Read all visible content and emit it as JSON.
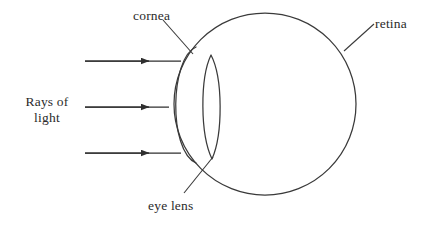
{
  "diagram": {
    "background_color": "#ffffff",
    "stroke_color": "#3a3a3a",
    "text_color": "#2b2b2b"
  },
  "labels": {
    "cornea": "cornea",
    "retina": "retina",
    "eye_lens": "eye lens",
    "rays_line1": "Rays of",
    "rays_line2": "light"
  },
  "parts": {
    "eyeball": {
      "name": "eyeball-outline",
      "shape": "circle",
      "cx": 265,
      "cy": 104,
      "r": 91
    },
    "cornea": {
      "name": "cornea-arc",
      "shape": "arc",
      "top_x": 196,
      "top_y": 47,
      "bottom_x": 196,
      "bottom_y": 163,
      "bulge_x": 168
    },
    "eye_lens": {
      "name": "eye-lens-biconvex",
      "shape": "lens",
      "cx": 211,
      "top_y": 55,
      "bottom_y": 159,
      "half_width": 11
    }
  },
  "rays": [
    {
      "name": "light-ray-top",
      "x1": 85,
      "y1": 61,
      "x2": 181,
      "y2": 61,
      "arrow_x": 147
    },
    {
      "name": "light-ray-middle",
      "x1": 85,
      "y1": 107,
      "x2": 169,
      "y2": 107,
      "arrow_x": 147
    },
    {
      "name": "light-ray-bottom",
      "x1": 85,
      "y1": 153,
      "x2": 181,
      "y2": 153,
      "arrow_x": 147
    }
  ],
  "leader_lines": [
    {
      "name": "cornea-leader",
      "x1": 163,
      "y1": 20,
      "x2": 193,
      "y2": 54
    },
    {
      "name": "retina-leader",
      "x1": 344,
      "y1": 51,
      "x2": 374,
      "y2": 24
    },
    {
      "name": "eye-lens-leader",
      "x1": 213,
      "y1": 157,
      "x2": 184,
      "y2": 193
    }
  ]
}
